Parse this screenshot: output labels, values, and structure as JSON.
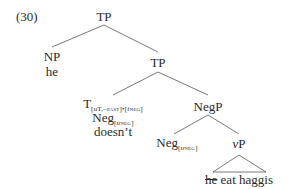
{
  "example_number": "(30)",
  "tree": {
    "root": "TP",
    "np": {
      "label": "NP",
      "word": "he"
    },
    "tp2": "TP",
    "t_node": {
      "label": "T",
      "features": "[uT,–PAST]•[iNEG]",
      "features_parts": {
        "u": "u",
        "t": "T,",
        "past": "–past",
        "bracket_close": "]•[",
        "i": "i",
        "neg": "neg",
        "end": "]"
      }
    },
    "t_neg": {
      "label": "Neg",
      "feature_open": "[",
      "u": "u",
      "neg": "neg",
      "feature_close": "]"
    },
    "t_word": "doesn’t",
    "negp": "NegP",
    "neg_head": {
      "label": "Neg",
      "feature_open": "[",
      "u": "u",
      "neg": "neg",
      "feature_close": "]"
    },
    "vp": {
      "v": "v",
      "p": "P"
    },
    "triangle_text": {
      "struck": "he",
      "rest": " eat haggis"
    }
  }
}
